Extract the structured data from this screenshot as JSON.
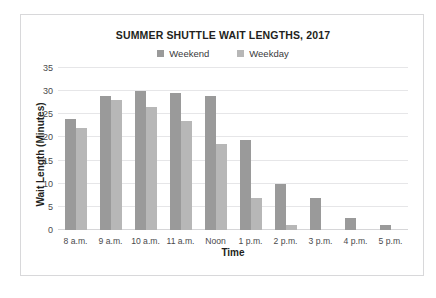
{
  "top_clipped_text": "·  ·  ·                                        ·  ·",
  "chart_data": {
    "type": "bar",
    "title": "SUMMER SHUTTLE WAIT LENGTHS, 2017",
    "xlabel": "Time",
    "ylabel": "Wait Length (Minutes)",
    "categories": [
      "8 a.m.",
      "9 a.m.",
      "10 a.m.",
      "11 a.m.",
      "Noon",
      "1 p.m.",
      "2 p.m.",
      "3 p.m.",
      "4 p.m.",
      "5 p.m."
    ],
    "series": [
      {
        "name": "Weekend",
        "color": "#9a9a9a",
        "values": [
          24,
          29,
          30,
          29.5,
          29,
          19.5,
          10,
          7,
          2.5,
          1
        ]
      },
      {
        "name": "Weekday",
        "color": "#b7b7b7",
        "values": [
          22,
          28,
          26.5,
          23.5,
          18.5,
          7,
          1,
          0,
          0,
          0
        ]
      }
    ],
    "ylim": [
      0,
      35
    ],
    "yticks": [
      0,
      5,
      10,
      15,
      20,
      25,
      30,
      35
    ],
    "ytick_labels": [
      "0",
      "5",
      "10",
      "15",
      "20",
      "25",
      "30",
      "35"
    ],
    "grid": true,
    "legend_position": "top-center"
  }
}
